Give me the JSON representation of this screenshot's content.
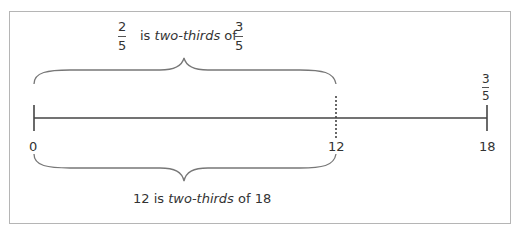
{
  "diagram": {
    "top_statement": {
      "frac_a": {
        "numerator": "2",
        "denominator": "5"
      },
      "text_pre": "is ",
      "text_em": "two-thirds",
      "text_post": " of",
      "frac_b": {
        "numerator": "3",
        "denominator": "5"
      }
    },
    "bottom_statement": {
      "text_pre": "12 is ",
      "text_em": "two-thirds",
      "text_post": " of 18"
    },
    "number_line": {
      "ticks": [
        {
          "label": "0",
          "value": 0
        },
        {
          "label": "12",
          "value": 12,
          "style": "dotted"
        },
        {
          "label": "18",
          "value": 18
        }
      ],
      "end_fraction": {
        "numerator": "3",
        "denominator": "5"
      }
    },
    "colors": {
      "line": "#444444",
      "brace": "#777777",
      "border": "#b5b5b5",
      "text": "#333333"
    }
  }
}
